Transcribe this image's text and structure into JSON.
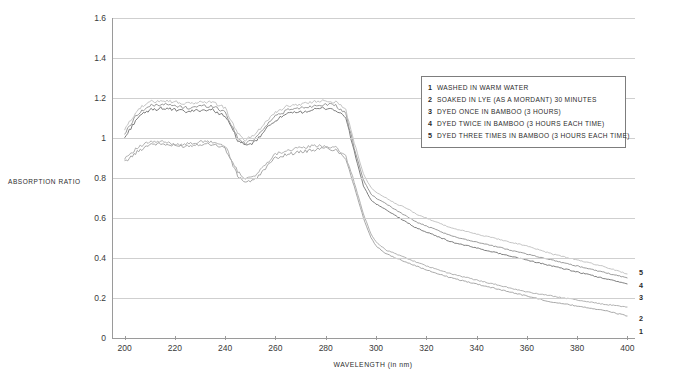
{
  "chart_data": {
    "type": "line",
    "title": "",
    "xlabel": "WAVELENGTH (in nm)",
    "ylabel": "ABSORPTION RATIO",
    "xlim": [
      195,
      403
    ],
    "ylim": [
      0,
      1.6
    ],
    "grid": true,
    "legend_position": "inside-top-right",
    "xticks": [
      200,
      220,
      240,
      260,
      280,
      300,
      320,
      340,
      360,
      380,
      400
    ],
    "yticks": [
      "0",
      "0.2",
      "0.4",
      "0.6",
      "0.8",
      "1",
      "1.2",
      "1.4",
      "1.6"
    ],
    "series": [
      {
        "name": "1",
        "label": "WASHED IN WARM WATER",
        "color": "#9d9d9d",
        "x": [
          200,
          205,
          210,
          215,
          220,
          225,
          230,
          235,
          240,
          245,
          248,
          252,
          256,
          260,
          265,
          270,
          275,
          280,
          284,
          288,
          292,
          295,
          298,
          300,
          304,
          308,
          312,
          316,
          320,
          330,
          340,
          350,
          360,
          370,
          380,
          390,
          400
        ],
        "y": [
          0.88,
          0.93,
          0.97,
          0.97,
          0.96,
          0.96,
          0.97,
          0.97,
          0.95,
          0.81,
          0.78,
          0.79,
          0.85,
          0.9,
          0.92,
          0.93,
          0.94,
          0.95,
          0.94,
          0.9,
          0.73,
          0.6,
          0.5,
          0.46,
          0.42,
          0.4,
          0.38,
          0.36,
          0.34,
          0.3,
          0.27,
          0.24,
          0.21,
          0.18,
          0.16,
          0.14,
          0.11
        ]
      },
      {
        "name": "2",
        "label": "SOAKED IN LYE (AS A MORDANT) 30 MINUTES",
        "color": "#a8a8a8",
        "x": [
          200,
          205,
          210,
          215,
          220,
          225,
          230,
          235,
          240,
          245,
          248,
          252,
          256,
          260,
          265,
          270,
          275,
          280,
          284,
          288,
          292,
          295,
          298,
          300,
          304,
          308,
          312,
          316,
          320,
          330,
          340,
          350,
          360,
          370,
          380,
          390,
          400
        ],
        "y": [
          0.9,
          0.95,
          0.98,
          0.98,
          0.97,
          0.97,
          0.98,
          0.98,
          0.96,
          0.83,
          0.8,
          0.81,
          0.87,
          0.92,
          0.94,
          0.95,
          0.96,
          0.96,
          0.95,
          0.91,
          0.75,
          0.62,
          0.52,
          0.48,
          0.44,
          0.42,
          0.4,
          0.38,
          0.36,
          0.32,
          0.29,
          0.26,
          0.23,
          0.21,
          0.19,
          0.17,
          0.155
        ]
      },
      {
        "name": "3",
        "label": "DYED ONCE IN BAMBOO (3 HOURS)",
        "color": "#6e6e6e",
        "x": [
          200,
          205,
          210,
          215,
          220,
          225,
          230,
          235,
          240,
          245,
          248,
          252,
          256,
          260,
          265,
          270,
          275,
          280,
          284,
          288,
          292,
          295,
          298,
          300,
          304,
          308,
          312,
          316,
          320,
          330,
          340,
          350,
          360,
          370,
          380,
          390,
          400
        ],
        "y": [
          1.0,
          1.1,
          1.14,
          1.15,
          1.14,
          1.13,
          1.14,
          1.14,
          1.11,
          0.99,
          0.96,
          0.98,
          1.04,
          1.09,
          1.12,
          1.13,
          1.14,
          1.15,
          1.14,
          1.1,
          0.9,
          0.76,
          0.69,
          0.67,
          0.64,
          0.61,
          0.58,
          0.55,
          0.53,
          0.48,
          0.45,
          0.42,
          0.39,
          0.36,
          0.33,
          0.3,
          0.27
        ]
      },
      {
        "name": "4",
        "label": "DYED TWICE IN BAMBOO (3 HOURS EACH TIME)",
        "color": "#8f8f8f",
        "x": [
          200,
          205,
          210,
          215,
          220,
          225,
          230,
          235,
          240,
          245,
          248,
          252,
          256,
          260,
          265,
          270,
          275,
          280,
          284,
          288,
          292,
          295,
          298,
          300,
          304,
          308,
          312,
          316,
          320,
          330,
          340,
          350,
          360,
          370,
          380,
          390,
          400
        ],
        "y": [
          1.02,
          1.12,
          1.16,
          1.17,
          1.16,
          1.15,
          1.16,
          1.16,
          1.13,
          1.0,
          0.97,
          1.0,
          1.06,
          1.11,
          1.14,
          1.15,
          1.16,
          1.17,
          1.16,
          1.12,
          0.92,
          0.79,
          0.72,
          0.7,
          0.67,
          0.64,
          0.61,
          0.58,
          0.56,
          0.51,
          0.48,
          0.45,
          0.42,
          0.39,
          0.36,
          0.33,
          0.3
        ]
      },
      {
        "name": "5",
        "label": "DYED THREE TIMES IN BAMBOO (3 HOURS EACH TIME)",
        "color": "#bdbdbd",
        "x": [
          200,
          205,
          210,
          215,
          220,
          225,
          230,
          235,
          240,
          245,
          248,
          252,
          256,
          260,
          265,
          270,
          275,
          280,
          284,
          288,
          292,
          295,
          298,
          300,
          304,
          308,
          312,
          316,
          320,
          330,
          340,
          350,
          360,
          370,
          380,
          390,
          400
        ],
        "y": [
          1.04,
          1.14,
          1.18,
          1.19,
          1.18,
          1.17,
          1.18,
          1.18,
          1.15,
          1.02,
          0.99,
          1.02,
          1.08,
          1.13,
          1.16,
          1.17,
          1.18,
          1.19,
          1.18,
          1.14,
          0.95,
          0.82,
          0.75,
          0.73,
          0.7,
          0.67,
          0.65,
          0.62,
          0.6,
          0.55,
          0.52,
          0.49,
          0.46,
          0.42,
          0.39,
          0.36,
          0.32
        ]
      }
    ]
  },
  "axis": {
    "y_title": "ABSORPTION RATIO",
    "x_title": "WAVELENGTH (in nm)",
    "y_labels": [
      "1.6",
      "1.4",
      "1.2",
      "1",
      "0.8",
      "0.6",
      "0.4",
      "0.2",
      "0"
    ],
    "x_labels": [
      "200",
      "220",
      "240",
      "260",
      "280",
      "300",
      "320",
      "340",
      "360",
      "380",
      "400"
    ]
  },
  "legend": {
    "items": [
      {
        "num": "1",
        "text": "WASHED IN WARM WATER"
      },
      {
        "num": "2",
        "text": "SOAKED IN LYE (AS A MORDANT) 30 MINUTES"
      },
      {
        "num": "3",
        "text": "DYED ONCE IN BAMBOO (3 HOURS)"
      },
      {
        "num": "4",
        "text": "DYED TWICE IN BAMBOO (3 HOURS EACH TIME)"
      },
      {
        "num": "5",
        "text": "DYED THREE TIMES IN BAMBOO (3 HOURS EACH TIME)"
      }
    ]
  },
  "end_labels": [
    {
      "num": "5",
      "top": 268
    },
    {
      "num": "4",
      "top": 281
    },
    {
      "num": "3",
      "top": 293
    },
    {
      "num": "2",
      "top": 314
    },
    {
      "num": "1",
      "top": 327
    }
  ]
}
